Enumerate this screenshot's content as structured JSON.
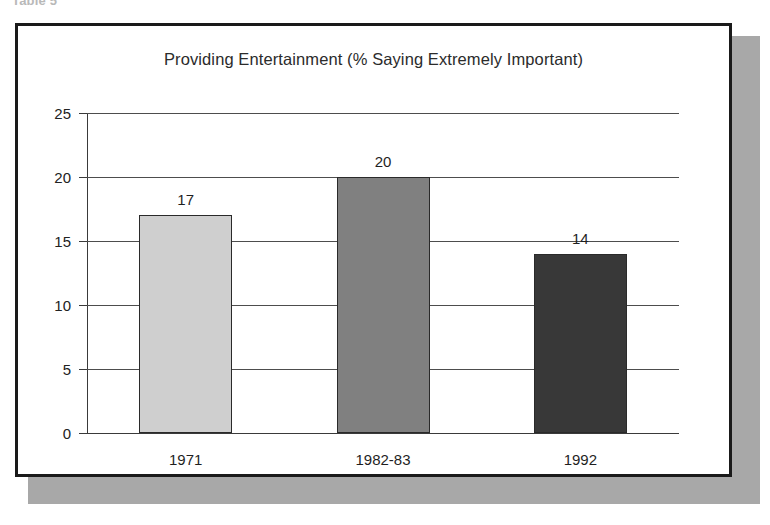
{
  "caption": "Table 5",
  "chart_data": {
    "type": "bar",
    "title": "Providing Entertainment (% Saying Extremely Important)",
    "xlabel": "",
    "ylabel": "",
    "categories": [
      "1971",
      "1982-83",
      "1992"
    ],
    "values": [
      17,
      20,
      14
    ],
    "value_labels": [
      "17",
      "20",
      "14"
    ],
    "bar_colors": [
      "#cfcfcf",
      "#808080",
      "#383838"
    ],
    "ylim": [
      0,
      25
    ],
    "yticks": [
      0,
      5,
      10,
      15,
      20,
      25
    ],
    "ytick_labels": [
      "0",
      "5",
      "10",
      "15",
      "20",
      "25"
    ],
    "grid": true,
    "legend": "none"
  },
  "style": {
    "frame_color": "#1a1a1a",
    "shadow_color": "#a8a8a8",
    "axis_color": "#3a3a3a",
    "background": "#ffffff"
  }
}
